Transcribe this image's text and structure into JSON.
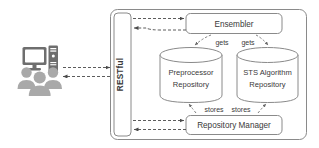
{
  "diagram": {
    "colors": {
      "stroke": "#8a8a8a",
      "text": "#3a3a3a",
      "dashed_arrow": "#4a4a4a",
      "icon_dark": "#6e6e6e",
      "icon_light": "#a9a9a9",
      "background": "#ffffff"
    },
    "actor": {
      "name": "users-with-computer",
      "icons": [
        "monitor-icon",
        "computer-tower-icon",
        "user-group-icon"
      ],
      "user_count": 3
    },
    "gateway": {
      "label": "RESTful",
      "orientation": "vertical"
    },
    "nodes": [
      {
        "id": "ensembler",
        "label": "Ensembler",
        "shape": "rounded-rect"
      },
      {
        "id": "preprocessor-repository",
        "label": "Preprocessor Repository",
        "line1": "Preprocessor",
        "line2": "Repository",
        "shape": "cylinder"
      },
      {
        "id": "sts-algorithm-repository",
        "label": "STS Algorithm Repository",
        "line1": "STS Algorithm",
        "line2": "Repository",
        "shape": "cylinder"
      },
      {
        "id": "repository-manager",
        "label": "Repository Manager",
        "shape": "rounded-rect"
      }
    ],
    "edges": [
      {
        "id": "actor-to-gateway",
        "from": "users-with-computer",
        "to": "RESTful",
        "label": "",
        "style": "dashed",
        "direction": "right"
      },
      {
        "id": "gateway-to-actor",
        "from": "RESTful",
        "to": "users-with-computer",
        "label": "",
        "style": "dashed",
        "direction": "left"
      },
      {
        "id": "gateway-to-ensembler",
        "from": "RESTful",
        "to": "Ensembler",
        "label": "",
        "style": "dashed",
        "direction": "right"
      },
      {
        "id": "ensembler-to-gateway",
        "from": "Ensembler",
        "to": "RESTful",
        "label": "",
        "style": "dashed",
        "direction": "left"
      },
      {
        "id": "ensembler-gets-preprocessor",
        "from": "Ensembler",
        "to": "Preprocessor Repository",
        "label": "gets",
        "style": "dashed",
        "direction": "down-left"
      },
      {
        "id": "ensembler-gets-sts",
        "from": "Ensembler",
        "to": "STS Algorithm Repository",
        "label": "gets",
        "style": "dashed",
        "direction": "down-right"
      },
      {
        "id": "manager-stores-preprocessor",
        "from": "Repository Manager",
        "to": "Preprocessor Repository",
        "label": "stores",
        "style": "dashed",
        "direction": "up-left"
      },
      {
        "id": "manager-stores-sts",
        "from": "Repository Manager",
        "to": "STS Algorithm Repository",
        "label": "stores",
        "style": "dashed",
        "direction": "up-right"
      },
      {
        "id": "gateway-to-manager",
        "from": "RESTful",
        "to": "Repository Manager",
        "label": "",
        "style": "dashed",
        "direction": "right"
      },
      {
        "id": "manager-to-gateway",
        "from": "Repository Manager",
        "to": "RESTful",
        "label": "",
        "style": "dashed",
        "direction": "left"
      }
    ],
    "edge_labels": {
      "gets_left": "gets",
      "gets_right": "gets",
      "stores_left": "stores",
      "stores_right": "stores"
    }
  }
}
